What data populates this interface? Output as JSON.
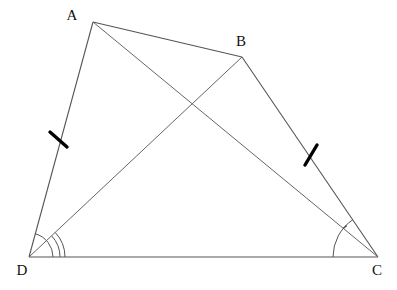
{
  "figure": {
    "background_color": "#ffffff",
    "line_color": "#555555",
    "tick_color": "#000000",
    "arc_color": "#555555",
    "label_color": "#111111",
    "width": 397,
    "height": 290
  },
  "vertices": [
    {
      "name": "A",
      "label": "A",
      "x": 93,
      "y": 22,
      "label_x": 72,
      "label_y": 17
    },
    {
      "name": "B",
      "label": "B",
      "x": 242,
      "y": 57,
      "label_x": 241,
      "label_y": 43
    },
    {
      "name": "C",
      "label": "C",
      "x": 378,
      "y": 257,
      "label_x": 377,
      "label_y": 272
    },
    {
      "name": "D",
      "label": "D",
      "x": 29,
      "y": 257,
      "label_x": 22,
      "label_y": 272
    }
  ],
  "segments": [
    {
      "name": "side-AB",
      "from": "A",
      "to": "B",
      "x1": 93,
      "y1": 22,
      "x2": 242,
      "y2": 57
    },
    {
      "name": "side-BC",
      "from": "B",
      "to": "C",
      "x1": 242,
      "y1": 57,
      "x2": 378,
      "y2": 257
    },
    {
      "name": "side-DC",
      "from": "D",
      "to": "C",
      "x1": 29,
      "y1": 257,
      "x2": 378,
      "y2": 257
    },
    {
      "name": "side-AD",
      "from": "A",
      "to": "D",
      "x1": 93,
      "y1": 22,
      "x2": 29,
      "y2": 257
    },
    {
      "name": "diagonal-AC",
      "from": "A",
      "to": "C",
      "x1": 93,
      "y1": 22,
      "x2": 378,
      "y2": 257
    },
    {
      "name": "diagonal-BD",
      "from": "B",
      "to": "D",
      "x1": 242,
      "y1": 57,
      "x2": 29,
      "y2": 257
    }
  ],
  "tick_marks": [
    {
      "name": "congruence-tick-AD",
      "on_segment": "side-AD",
      "x1": 50,
      "y1": 132,
      "x2": 67,
      "y2": 147
    },
    {
      "name": "congruence-tick-BC",
      "on_segment": "side-BC",
      "x1": 317,
      "y1": 145,
      "x2": 305,
      "y2": 165
    }
  ],
  "angle_marks": [
    {
      "name": "angle-arc-ADB-outer",
      "vertex": "D",
      "radius": 36,
      "start_deg": 0,
      "end_deg": 43
    },
    {
      "name": "angle-arc-ADB-inner",
      "vertex": "D",
      "radius": 31,
      "start_deg": 0,
      "end_deg": 43
    },
    {
      "name": "angle-arc-ADC",
      "vertex": "D",
      "radius": 24,
      "start_deg": 0,
      "end_deg": 75
    },
    {
      "name": "angle-arc-BCD",
      "vertex": "C",
      "radius": 45,
      "start_deg": 180,
      "end_deg": 124
    },
    {
      "name": "angle-tick-ACD",
      "vertex": "C",
      "radius": 45,
      "start_deg": 140,
      "end_deg": 134
    }
  ],
  "intersection": {
    "name": "diagonal-crossing-point",
    "x": 190,
    "y": 103
  }
}
